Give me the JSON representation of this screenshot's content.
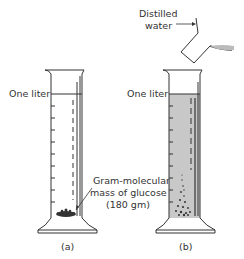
{
  "figure": {
    "panel_a": {
      "level_label": "One liter",
      "annotation": [
        "Gram-molecular",
        "mass of glucose",
        "(180 gm)"
      ],
      "caption": "(a)"
    },
    "panel_b": {
      "level_label": "One liter",
      "pour_label": [
        "Distilled",
        "water"
      ],
      "caption": "(b)"
    },
    "colors": {
      "line": "#333333",
      "liquid": "#c8c8c8",
      "background": "#ffffff"
    }
  }
}
